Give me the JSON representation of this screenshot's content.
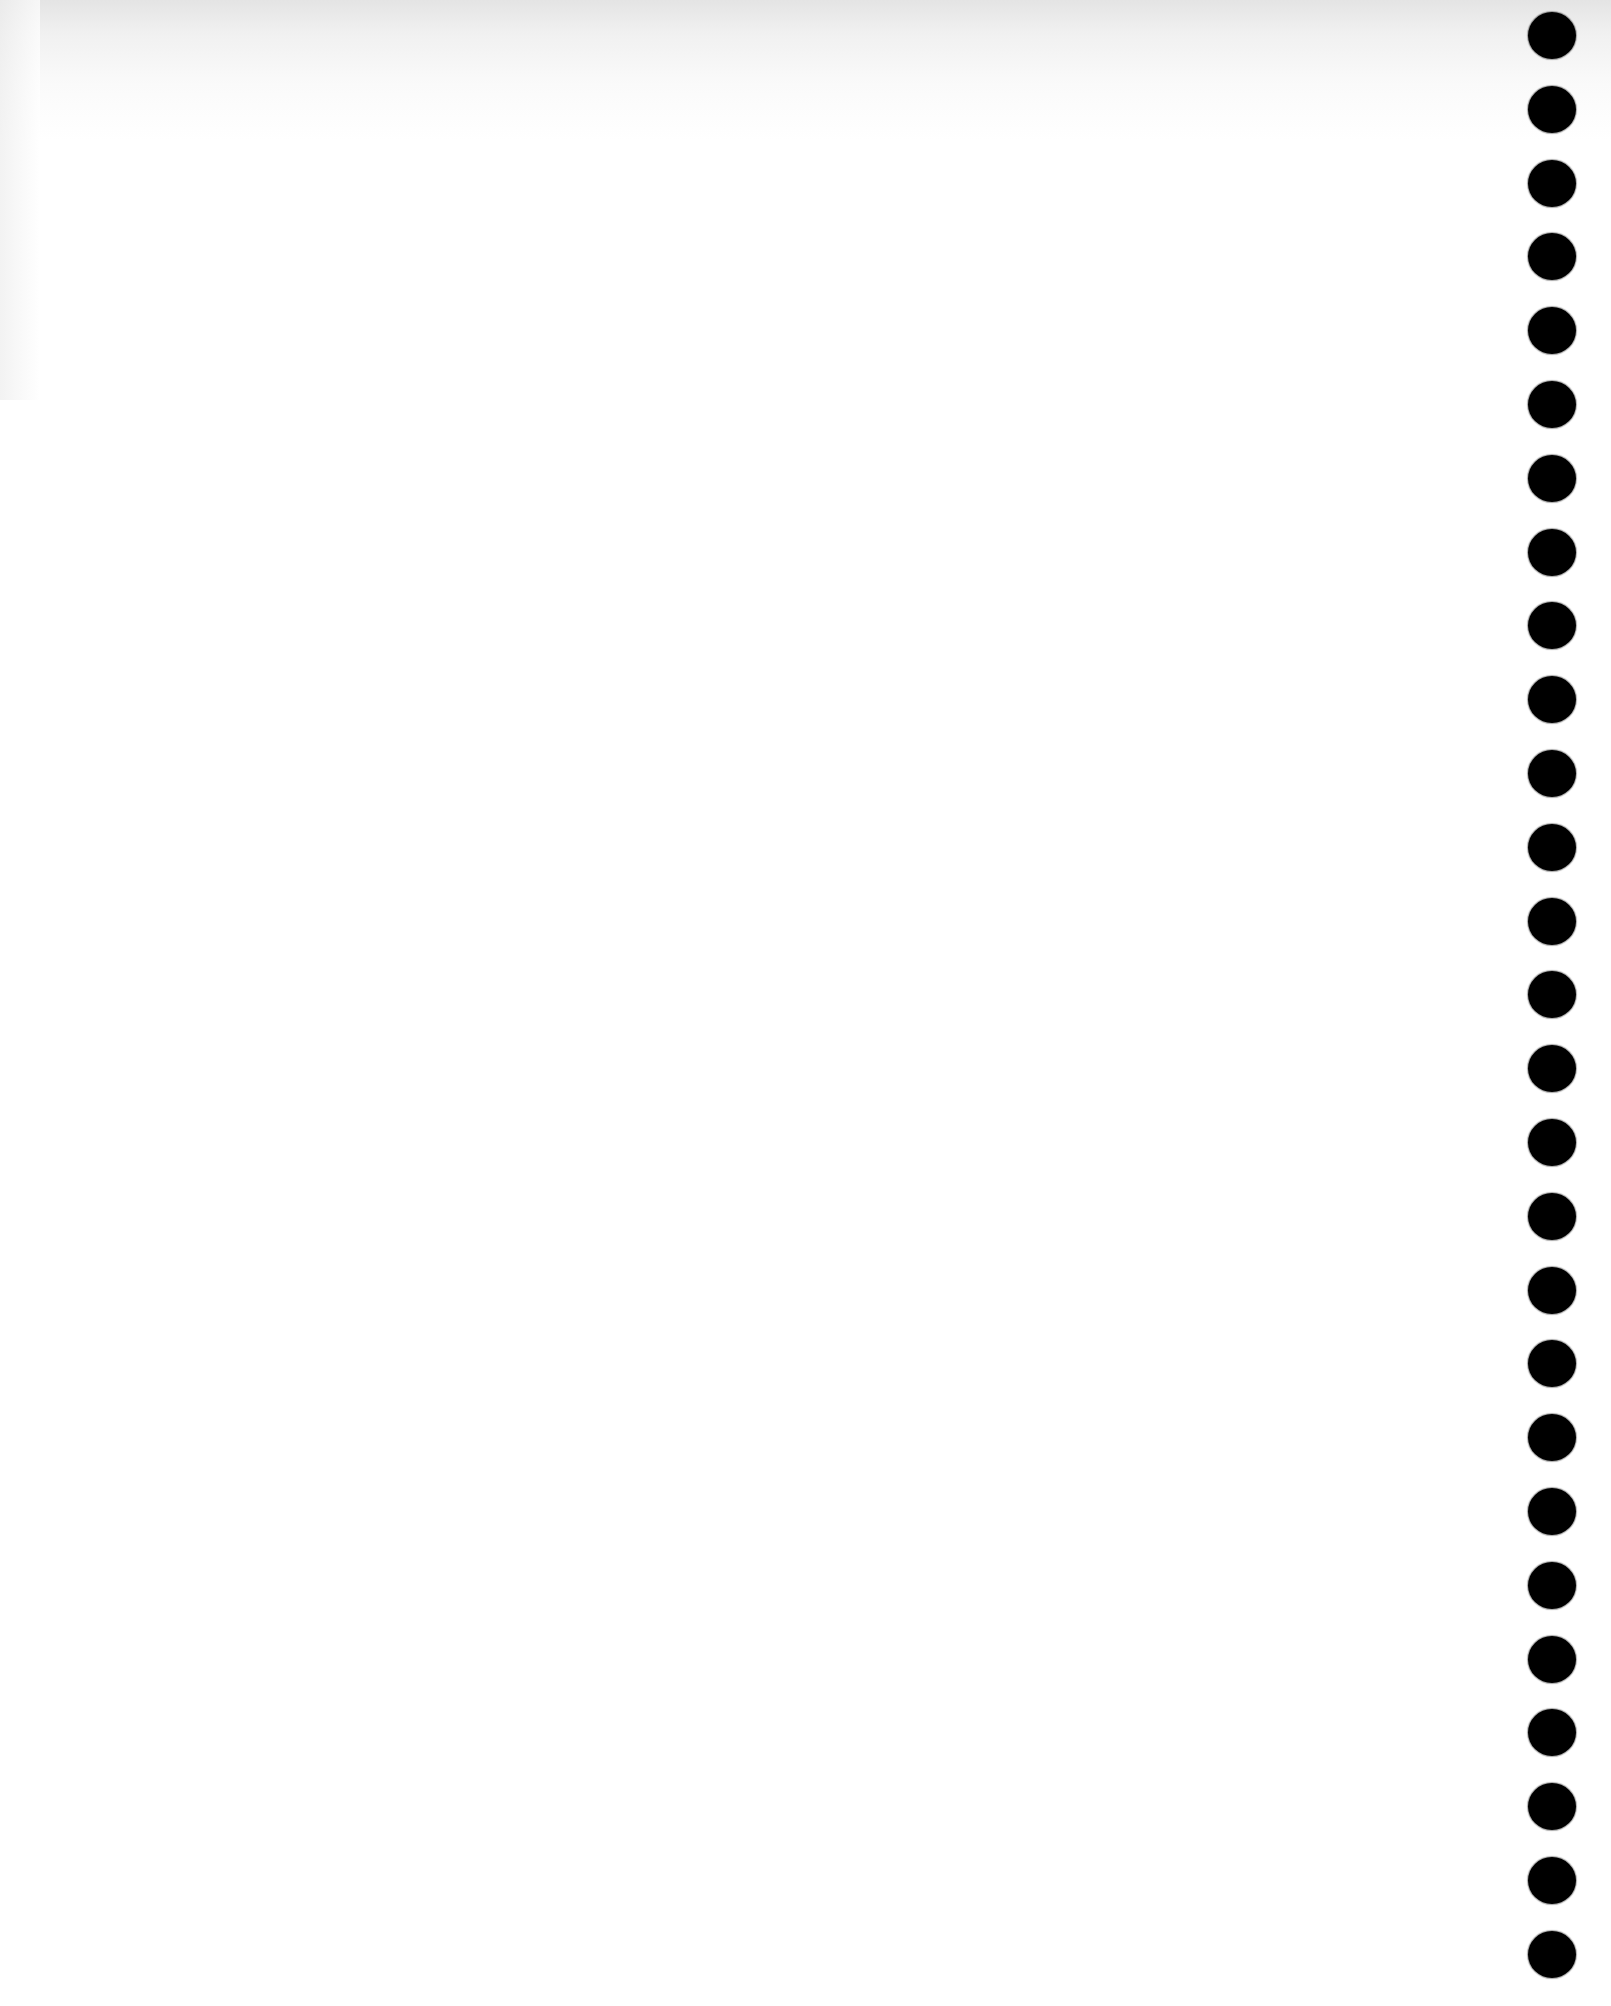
{
  "page": {
    "type": "blank-notebook-page",
    "background_color": "#ffffff",
    "top_edge_shading_color": "#e4e4e4",
    "visible_text": []
  },
  "binding": {
    "side": "right",
    "hole_color": "#000000",
    "hole_count": 27,
    "hole_center_x": 1552,
    "first_hole_center_y": 36,
    "hole_spacing_y": 73.8,
    "hole_diameter": 48
  }
}
